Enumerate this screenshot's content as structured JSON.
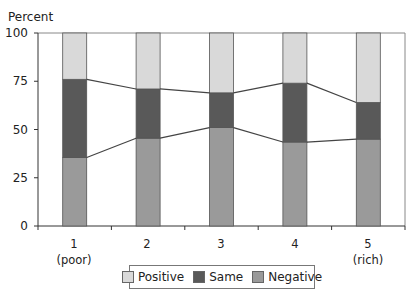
{
  "chart_data": {
    "type": "bar",
    "stacked": true,
    "title": "",
    "ylabel": "Percent",
    "xlabel": "",
    "ylim": [
      0,
      100
    ],
    "yticks": [
      0,
      25,
      50,
      75,
      100
    ],
    "categories": [
      "1\n(poor)",
      "2",
      "3",
      "4",
      "5\n(rich)"
    ],
    "category_labels": [
      {
        "line1": "1",
        "line2": "(poor)"
      },
      {
        "line1": "2",
        "line2": ""
      },
      {
        "line1": "3",
        "line2": ""
      },
      {
        "line1": "4",
        "line2": ""
      },
      {
        "line1": "5",
        "line2": "(rich)"
      }
    ],
    "series": [
      {
        "name": "Negative",
        "color": "#9a9a9a",
        "values": [
          35.5,
          45.5,
          51,
          43.5,
          45
        ]
      },
      {
        "name": "Same",
        "color": "#595959",
        "values": [
          40.5,
          25.5,
          18,
          30.5,
          19
        ]
      },
      {
        "name": "Positive",
        "color": "#d9d9d9",
        "values": [
          24,
          29,
          31,
          26,
          36
        ]
      }
    ],
    "connector_lines": true,
    "grid": false,
    "legend": {
      "position": "bottom",
      "entries": [
        "Positive",
        "Same",
        "Negative"
      ]
    }
  }
}
